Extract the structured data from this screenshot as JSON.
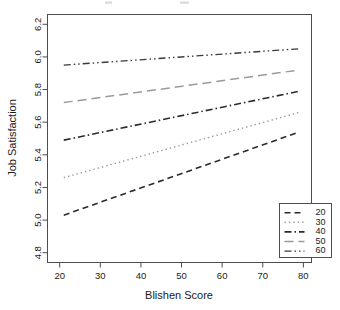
{
  "chart_data": {
    "type": "line",
    "title": "",
    "xlabel": "Blishen Score",
    "ylabel": "Job Satisfaction",
    "xlim": [
      17,
      82
    ],
    "ylim": [
      4.74,
      6.26
    ],
    "xticks": [
      20,
      30,
      40,
      50,
      60,
      70,
      80
    ],
    "xtick_labels": [
      "20",
      "30",
      "40",
      "50",
      "60",
      "70",
      "80"
    ],
    "yticks": [
      4.8,
      5.0,
      5.2,
      5.4,
      5.6,
      5.8,
      6.0,
      6.2
    ],
    "ytick_labels": [
      "4.8",
      "5.0",
      "5.2",
      "5.4",
      "5.6",
      "5.8",
      "6.0",
      "6.2"
    ],
    "grid": false,
    "legend_position": "bottom-right",
    "legend_title": "",
    "x": [
      21,
      79
    ],
    "series": [
      {
        "name": "20",
        "label": "20",
        "values": [
          5.03,
          5.54
        ],
        "style": "dashed",
        "color": "#2b2b2b",
        "dasharray": "6,4",
        "width": 1.6
      },
      {
        "name": "30",
        "label": "30",
        "values": [
          5.26,
          5.66
        ],
        "style": "dotted",
        "color": "#9a9a9a",
        "dasharray": "1.4,3",
        "width": 1.4
      },
      {
        "name": "40",
        "label": "40",
        "values": [
          5.49,
          5.79
        ],
        "style": "dashdot",
        "color": "#2b2b2b",
        "dasharray": "7,3,1.5,3",
        "width": 1.6
      },
      {
        "name": "50",
        "label": "50",
        "values": [
          5.72,
          5.92
        ],
        "style": "longdash",
        "color": "#9a9a9a",
        "dasharray": "9,5",
        "width": 1.5
      },
      {
        "name": "60",
        "label": "60",
        "values": [
          5.95,
          6.05
        ],
        "style": "dashdotdot",
        "color": "#3a3a3a",
        "dasharray": "7,3,1.5,3,1.5,3",
        "width": 1.4
      }
    ]
  },
  "legend": {
    "entries": [
      {
        "label": "20"
      },
      {
        "label": "30"
      },
      {
        "label": "40"
      },
      {
        "label": "50"
      },
      {
        "label": "60"
      }
    ]
  },
  "colors": {
    "frame": "#4d4d4d",
    "text": "#1a1a1a",
    "background": "#ffffff"
  }
}
